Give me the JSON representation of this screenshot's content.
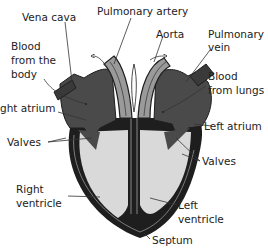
{
  "diagram": {
    "colors": {
      "atrium": "#4a4a4a",
      "vessel_light": "#9a9a9a",
      "chamber_fill": "#d9d9d9",
      "wall": "#1e1e1e",
      "background": "#ffffff"
    },
    "labels": {
      "vena_cava": "Vena cava",
      "pulmonary_artery": "Pulmonary artery",
      "aorta": "Aorta",
      "pulmonary_vein_1": "Pulmonary",
      "pulmonary_vein_2": "vein",
      "blood_from_body_1": "Blood",
      "blood_from_body_2": "from the",
      "blood_from_body_3": "body",
      "blood_from_lungs_1": "Blood",
      "blood_from_lungs_2": "from lungs",
      "right_atrium": "ght atrium",
      "left_atrium": "Left atrium",
      "valves_left_side": "Valves",
      "valves_right_side": "Valves",
      "right_ventricle_1": "Right",
      "right_ventricle_2": "ventricle",
      "left_ventricle_1": "Left",
      "left_ventricle_2": "ventricle",
      "septum": "Septum"
    }
  }
}
